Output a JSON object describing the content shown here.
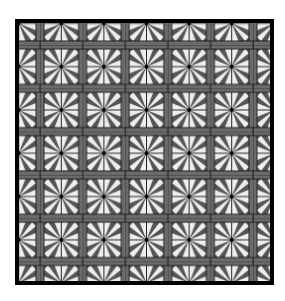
{
  "image": {
    "description": "Tiled geometric starburst pattern inside a thick black square frame",
    "grid": {
      "columns": 6,
      "rows": 6
    },
    "colors": {
      "background": "#ffffff",
      "frame": "#000000",
      "star_fill": "#555555",
      "spoke_fill": "#eeeeee",
      "bar_fill": "#6b6b6b",
      "line": "#111111"
    }
  }
}
